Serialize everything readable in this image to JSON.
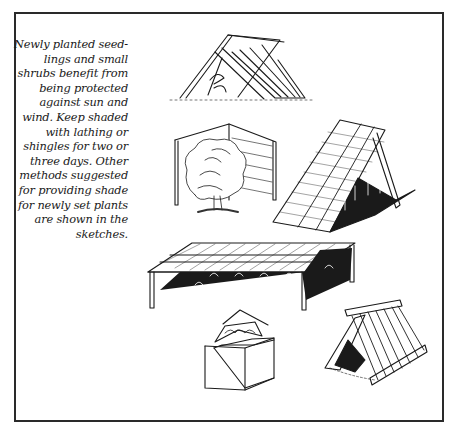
{
  "caption": {
    "lines": [
      "Newly planted seed-",
      "lings and small",
      "shrubs benefit from",
      "being protected",
      "against sun and",
      "wind. Keep shaded",
      "with lathing or",
      "shingles for two or",
      "three days. Other",
      "methods suggested",
      "for providing shade",
      "for newly set plants",
      "are shown in the",
      "sketches."
    ]
  },
  "illustrations": [
    {
      "id": "a-frame-boards-tent",
      "description": "A-frame of boards over a seedling"
    },
    {
      "id": "corner-screen-shrub",
      "description": "Two-panel corner screen sheltering a shrub"
    },
    {
      "id": "lath-lean-to",
      "description": "Leaning lath panel over row of seedlings"
    },
    {
      "id": "lath-canopy-table",
      "description": "Flat lath canopy on posts over seedlings"
    },
    {
      "id": "open-box-lid",
      "description": "Box with propped lid over a plant"
    },
    {
      "id": "slatted-a-frame",
      "description": "Small slatted A-frame over a plant"
    }
  ],
  "colors": {
    "ink": "#1a1a1a",
    "paper": "#ffffff",
    "frame": "#2a2a2a"
  }
}
